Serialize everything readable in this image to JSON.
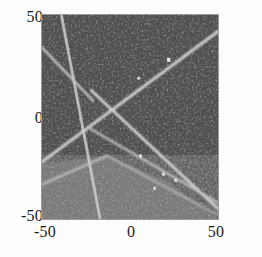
{
  "figure": {
    "kind": "density-plot",
    "title": "",
    "background_color": "#fdfdfd",
    "frame_color": "#9a9a9a"
  },
  "axes": {
    "x_label": "",
    "y_label": "",
    "x_ticks": [
      "-50",
      "0",
      "50"
    ],
    "y_ticks": [
      "50",
      "0",
      "-50"
    ],
    "x_min": -50,
    "x_max": 50,
    "y_min": -50,
    "y_max": 50,
    "grid": false
  },
  "chart_data": {
    "type": "heatmap",
    "title": "",
    "xlabel": "",
    "ylabel": "",
    "xlim": [
      -50,
      50
    ],
    "ylim": [
      -50,
      50
    ],
    "grid": false,
    "legend": "none",
    "xticks": [
      -50,
      0,
      50
    ],
    "yticks": [
      -50,
      0,
      50
    ],
    "xtick_labels": [
      "-50",
      "0",
      "50"
    ],
    "ytick_labels": [
      "-50",
      "0",
      "50"
    ],
    "colors": {
      "background_dark": "#4c4c4c",
      "background_light": "#7d7d7d",
      "ridge_bright": "#d8d8d8",
      "noise_amplitude": 0.16
    },
    "regions": [
      {
        "name": "lower-left-light-wedge",
        "fill": "#7d7d7d",
        "polygon": [
          [
            -50,
            -23
          ],
          [
            -50,
            -50
          ],
          [
            50,
            -50
          ],
          [
            22,
            -32
          ],
          [
            -13,
            -19
          ]
        ]
      }
    ],
    "ridges": [
      {
        "name": "steep-descending-ridge",
        "from": [
          -39,
          50
        ],
        "to": [
          -17,
          -50
        ],
        "brightness": 0.88,
        "width": 1.6
      },
      {
        "name": "upper-left-edge-ridge",
        "from": [
          -50,
          34
        ],
        "to": [
          -21,
          8
        ],
        "brightness": 0.8,
        "width": 1.5
      },
      {
        "name": "main-diagonal-rising-ridge",
        "from": [
          -50,
          -22
        ],
        "to": [
          50,
          42
        ],
        "brightness": 0.92,
        "width": 1.6
      },
      {
        "name": "center-descending-ridge",
        "from": [
          -22,
          13
        ],
        "to": [
          50,
          -45
        ],
        "brightness": 0.9,
        "width": 1.6
      },
      {
        "name": "lower-fan-ridge",
        "from": [
          -24,
          -5
        ],
        "to": [
          50,
          -42
        ],
        "brightness": 0.82,
        "width": 1.4
      },
      {
        "name": "lower-left-rising-ridge",
        "from": [
          -50,
          -33
        ],
        "to": [
          -13,
          -19
        ],
        "brightness": 0.78,
        "width": 1.4
      },
      {
        "name": "wedge-boundary-ridge",
        "from": [
          -13,
          -19
        ],
        "to": [
          50,
          -48
        ],
        "brightness": 0.7,
        "width": 1.3
      }
    ],
    "bright_spots": [
      {
        "x": 22,
        "y": 28,
        "brightness": 1.0
      },
      {
        "x": 5,
        "y": 19,
        "brightness": 0.95
      },
      {
        "x": 6,
        "y": -19,
        "brightness": 0.95
      },
      {
        "x": 19,
        "y": -28,
        "brightness": 0.95
      },
      {
        "x": 26,
        "y": -31,
        "brightness": 0.95
      },
      {
        "x": 14,
        "y": -35,
        "brightness": 0.9
      }
    ]
  }
}
